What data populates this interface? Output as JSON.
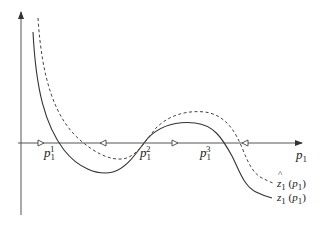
{
  "diagram": {
    "axes": {
      "x_label_var": "p",
      "x_label_sub": "1",
      "has_vertical_axis": true
    },
    "equilibria": [
      {
        "var": "p",
        "sub": "1",
        "sup": "1"
      },
      {
        "var": "p",
        "sub": "1",
        "sup": "2"
      },
      {
        "var": "p",
        "sub": "1",
        "sup": "3"
      }
    ],
    "flow_arrows": [
      {
        "position": "left of p1^1",
        "direction": "right"
      },
      {
        "position": "between p1^1 and p1^2",
        "direction": "left"
      },
      {
        "position": "between p1^2 and p1^3",
        "direction": "right"
      },
      {
        "position": "right of p1^3",
        "direction": "left"
      }
    ],
    "curves": [
      {
        "name": "z1",
        "style": "solid",
        "label_var": "z",
        "label_sub": "1",
        "label_arg_var": "p",
        "label_arg_sub": "1"
      },
      {
        "name": "z1-hat",
        "style": "dashed",
        "label_var": "z",
        "label_sub": "1",
        "label_arg_var": "p",
        "label_arg_sub": "1",
        "hat": true
      }
    ],
    "colors": {
      "line": "#333333",
      "background": "#ffffff"
    }
  }
}
